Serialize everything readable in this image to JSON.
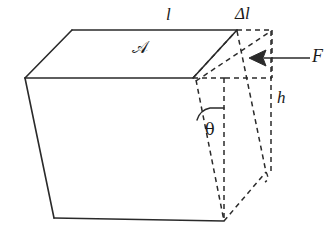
{
  "figure": {
    "kind": "shear-deformation-block-diagram",
    "background_color": "#ffffff",
    "stroke_color": "#2a2a2a",
    "labels": {
      "length": "l",
      "delta_length": "Δl",
      "area": "𝒜",
      "force": "F",
      "height": "h",
      "shear_angle": "θ"
    },
    "geometry": {
      "solid_block": {
        "top_face": [
          [
            72,
            30
          ],
          [
            237,
            30
          ],
          [
            193,
            78
          ],
          [
            25,
            78
          ]
        ],
        "left_edge": [
          [
            25,
            78
          ],
          [
            54,
            218
          ]
        ],
        "bottom_edge": [
          [
            54,
            218
          ],
          [
            224,
            221
          ]
        ],
        "front_top_edge": [
          [
            25,
            78
          ],
          [
            193,
            78
          ]
        ]
      },
      "dashed_sheared": {
        "top_right_rect": [
          [
            237,
            30
          ],
          [
            272,
            30
          ],
          [
            272,
            78
          ],
          [
            225,
            78
          ]
        ],
        "front_top_dashed": [
          [
            193,
            78
          ],
          [
            225,
            78
          ]
        ],
        "slant_left": [
          [
            196,
            80
          ],
          [
            224,
            221
          ]
        ],
        "vertical_mid": [
          [
            224,
            78
          ],
          [
            224,
            221
          ]
        ],
        "slant_right": [
          [
            237,
            31
          ],
          [
            266,
            172
          ]
        ],
        "vertical_right": [
          [
            271,
            31
          ],
          [
            271,
            172
          ]
        ],
        "bottom_right_slant": [
          [
            224,
            221
          ],
          [
            266,
            172
          ]
        ],
        "diag_top": [
          [
            193,
            78
          ],
          [
            237,
            30
          ]
        ],
        "diag_inner": [
          [
            196,
            80
          ],
          [
            272,
            31
          ]
        ]
      },
      "force_arrow": {
        "from": [
          310,
          58
        ],
        "to": [
          249,
          58
        ]
      },
      "theta_arc": {
        "center": [
          224,
          78
        ],
        "radius": 36,
        "from_deg": 180,
        "to_deg": 101
      }
    }
  }
}
